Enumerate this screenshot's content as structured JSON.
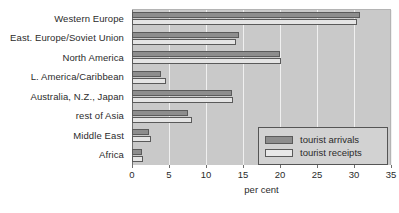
{
  "chart_data": {
    "type": "bar",
    "orientation": "horizontal",
    "title": "",
    "xlabel": "per cent",
    "ylabel": "",
    "xlim": [
      0,
      35
    ],
    "xticks": [
      0,
      5,
      10,
      15,
      20,
      25,
      30,
      35
    ],
    "grid": true,
    "legend_position": "bottom-right",
    "categories": [
      "Western Europe",
      "East. Europe/Soviet Union",
      "North America",
      "L. America/Caribbean",
      "Australia, N.Z., Japan",
      "rest of Asia",
      "Middle East",
      "Africa"
    ],
    "series": [
      {
        "name": "tourist arrivals",
        "color": "#8d8d8d",
        "values": [
          30.8,
          14.5,
          20.0,
          3.9,
          13.5,
          7.5,
          2.3,
          1.4
        ]
      },
      {
        "name": "tourist receipts",
        "color": "#e4e4e4",
        "values": [
          30.4,
          14.1,
          20.2,
          4.6,
          13.7,
          8.1,
          2.6,
          1.5
        ]
      }
    ]
  },
  "legend": {
    "items": [
      {
        "label": "tourist arrivals"
      },
      {
        "label": "tourist receipts"
      }
    ]
  },
  "axis": {
    "x_title": "per cent"
  },
  "colors": {
    "plot_background": "#c9c9c9",
    "gridline": "#f0f0f0",
    "axis": "#6e6e6e",
    "arrivals": "#8d8d8d",
    "receipts": "#e4e4e4",
    "text": "#2b2b2b"
  }
}
